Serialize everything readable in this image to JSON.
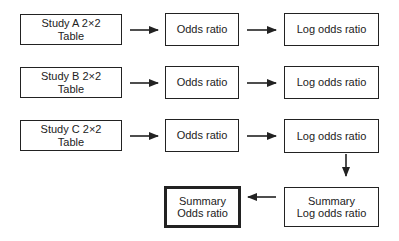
{
  "diagram": {
    "type": "flowchart",
    "nodes": {
      "study_a": {
        "line1": "Study A 2×2",
        "line2": "Table"
      },
      "or_a": {
        "label": "Odds ratio"
      },
      "lor_a": {
        "label": "Log odds ratio"
      },
      "study_b": {
        "line1": "Study B 2×2",
        "line2": "Table"
      },
      "or_b": {
        "label": "Odds ratio"
      },
      "lor_b": {
        "label": "Log odds ratio"
      },
      "study_c": {
        "line1": "Study C 2×2",
        "line2": "Table"
      },
      "or_c": {
        "label": "Odds ratio"
      },
      "lor_c": {
        "label": "Log odds ratio"
      },
      "summary_lor": {
        "line1": "Summary",
        "line2": "Log odds ratio"
      },
      "summary_or": {
        "line1": "Summary",
        "line2": "Odds ratio",
        "emphasis": "thick-border"
      }
    },
    "edges": [
      {
        "from": "study_a",
        "to": "or_a"
      },
      {
        "from": "or_a",
        "to": "lor_a"
      },
      {
        "from": "study_b",
        "to": "or_b"
      },
      {
        "from": "or_b",
        "to": "lor_b"
      },
      {
        "from": "study_c",
        "to": "or_c"
      },
      {
        "from": "or_c",
        "to": "lor_c"
      },
      {
        "from": "lor_c",
        "to": "summary_lor"
      },
      {
        "from": "summary_lor",
        "to": "summary_or"
      }
    ],
    "colors": {
      "stroke": "#222222",
      "background": "#ffffff"
    }
  }
}
